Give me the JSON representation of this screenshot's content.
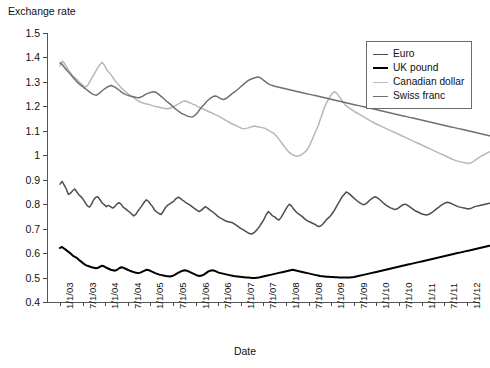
{
  "chart_data": {
    "type": "line",
    "title": "",
    "xlabel": "Date",
    "ylabel": "Exchange rate",
    "ylim": [
      0.4,
      1.5
    ],
    "ytick_labels": [
      "1.5",
      "1.4",
      "1.3",
      "1.2",
      "1.1",
      "1",
      "0.9",
      "0.8",
      "0.7",
      "0.6",
      "0.5",
      "0.4"
    ],
    "ytick_values": [
      1.5,
      1.4,
      1.3,
      1.2,
      1.1,
      1.0,
      0.9,
      0.8,
      0.7,
      0.6,
      0.5,
      0.4
    ],
    "grid": false,
    "legend_position": "top-right",
    "x_start": "1/1/03",
    "x_end": "7/1/12",
    "xtick_labels": [
      "1/1/03",
      "7/1/03",
      "1/1/04",
      "7/1/04",
      "1/1/05",
      "7/1/05",
      "1/1/06",
      "7/1/06",
      "1/1/07",
      "7/1/07",
      "1/1/08",
      "7/1/08",
      "1/1/09",
      "7/1/09",
      "1/1/10",
      "7/1/10",
      "1/1/11",
      "7/1/11",
      "1/1/12"
    ],
    "series": [
      {
        "name": "Euro",
        "color": "#4d4d4d",
        "width": 1.5,
        "values": [
          0.882,
          0.893,
          0.878,
          0.862,
          0.84,
          0.845,
          0.855,
          0.862,
          0.85,
          0.838,
          0.83,
          0.82,
          0.806,
          0.793,
          0.788,
          0.8,
          0.818,
          0.828,
          0.83,
          0.818,
          0.805,
          0.798,
          0.79,
          0.795,
          0.79,
          0.784,
          0.79,
          0.8,
          0.806,
          0.8,
          0.788,
          0.782,
          0.775,
          0.768,
          0.76,
          0.752,
          0.758,
          0.772,
          0.783,
          0.795,
          0.808,
          0.818,
          0.812,
          0.8,
          0.79,
          0.775,
          0.768,
          0.762,
          0.758,
          0.77,
          0.785,
          0.795,
          0.8,
          0.806,
          0.812,
          0.822,
          0.828,
          0.825,
          0.818,
          0.812,
          0.805,
          0.8,
          0.795,
          0.788,
          0.782,
          0.776,
          0.77,
          0.774,
          0.782,
          0.79,
          0.785,
          0.778,
          0.772,
          0.765,
          0.758,
          0.75,
          0.744,
          0.74,
          0.735,
          0.73,
          0.728,
          0.726,
          0.724,
          0.718,
          0.712,
          0.706,
          0.7,
          0.696,
          0.69,
          0.685,
          0.68,
          0.678,
          0.682,
          0.69,
          0.7,
          0.712,
          0.725,
          0.74,
          0.758,
          0.77,
          0.762,
          0.752,
          0.748,
          0.74,
          0.735,
          0.745,
          0.76,
          0.775,
          0.79,
          0.8,
          0.792,
          0.78,
          0.77,
          0.762,
          0.756,
          0.75,
          0.742,
          0.735,
          0.73,
          0.726,
          0.722,
          0.718,
          0.712,
          0.708,
          0.712,
          0.72,
          0.73,
          0.74,
          0.748,
          0.758,
          0.77,
          0.785,
          0.8,
          0.815,
          0.83,
          0.84,
          0.85,
          0.845,
          0.838,
          0.83,
          0.822,
          0.815,
          0.808,
          0.802,
          0.798,
          0.8,
          0.806,
          0.815,
          0.822,
          0.828,
          0.83,
          0.825,
          0.818,
          0.81,
          0.802,
          0.795,
          0.79,
          0.785,
          0.782,
          0.778,
          0.78,
          0.786,
          0.792,
          0.798,
          0.8,
          0.796,
          0.79,
          0.784,
          0.778,
          0.772,
          0.768,
          0.764,
          0.76,
          0.758,
          0.756,
          0.758,
          0.762,
          0.768,
          0.775,
          0.782,
          0.788,
          0.795,
          0.8,
          0.805,
          0.808,
          0.806,
          0.802,
          0.798,
          0.794,
          0.79,
          0.788,
          0.786,
          0.784,
          0.782,
          0.78,
          0.782,
          0.786,
          0.79,
          0.792,
          0.794,
          0.796,
          0.798,
          0.8,
          0.802,
          0.804
        ]
      },
      {
        "name": "UK pound",
        "color": "#000000",
        "width": 2.0,
        "values": [
          0.621,
          0.625,
          0.618,
          0.612,
          0.605,
          0.598,
          0.59,
          0.585,
          0.58,
          0.572,
          0.565,
          0.558,
          0.552,
          0.548,
          0.545,
          0.542,
          0.54,
          0.538,
          0.54,
          0.545,
          0.548,
          0.545,
          0.54,
          0.536,
          0.532,
          0.53,
          0.528,
          0.532,
          0.538,
          0.542,
          0.54,
          0.536,
          0.532,
          0.528,
          0.525,
          0.522,
          0.52,
          0.518,
          0.52,
          0.524,
          0.528,
          0.532,
          0.53,
          0.526,
          0.522,
          0.518,
          0.515,
          0.512,
          0.51,
          0.508,
          0.506,
          0.505,
          0.504,
          0.506,
          0.51,
          0.515,
          0.52,
          0.524,
          0.528,
          0.53,
          0.528,
          0.524,
          0.52,
          0.516,
          0.512,
          0.508,
          0.506,
          0.508,
          0.512,
          0.518,
          0.524,
          0.528,
          0.53,
          0.528,
          0.524,
          0.52,
          0.518,
          0.516,
          0.514,
          0.512,
          0.51,
          0.508,
          0.506,
          0.505,
          0.504,
          0.503,
          0.502,
          0.501,
          0.5,
          0.5,
          0.499,
          0.498,
          0.498,
          0.499,
          0.5,
          0.502,
          0.504,
          0.506,
          0.508,
          0.51,
          0.512,
          0.514,
          0.516,
          0.518,
          0.52,
          0.522,
          0.524,
          0.526,
          0.528,
          0.53,
          0.532,
          0.53,
          0.528,
          0.526,
          0.524,
          0.522,
          0.52,
          0.518,
          0.516,
          0.514,
          0.512,
          0.51,
          0.508,
          0.506,
          0.505,
          0.504,
          0.503,
          0.503,
          0.502,
          0.502,
          0.501,
          0.501,
          0.5,
          0.5,
          0.5,
          0.5,
          0.5,
          0.5,
          0.501,
          0.502,
          0.504,
          0.506,
          0.508,
          0.51,
          0.512,
          0.514,
          0.516,
          0.518,
          0.52,
          0.522,
          0.524,
          0.526,
          0.528,
          0.53,
          0.532,
          0.534,
          0.536,
          0.538,
          0.54,
          0.542,
          0.544,
          0.546,
          0.548,
          0.55,
          0.552,
          0.554,
          0.556,
          0.558,
          0.56,
          0.562,
          0.564,
          0.566,
          0.568,
          0.57,
          0.572,
          0.574,
          0.576,
          0.578,
          0.58,
          0.582,
          0.584,
          0.586,
          0.588,
          0.59,
          0.592,
          0.594,
          0.596,
          0.598,
          0.6,
          0.602,
          0.604,
          0.606,
          0.608,
          0.61,
          0.612,
          0.614,
          0.616,
          0.618,
          0.62,
          0.622,
          0.624,
          0.626,
          0.628,
          0.63
        ]
      },
      {
        "name": "Canadian dollar",
        "color": "#b7b7b7",
        "width": 1.5,
        "values": [
          1.365,
          1.385,
          1.378,
          1.362,
          1.348,
          1.338,
          1.325,
          1.318,
          1.31,
          1.3,
          1.292,
          1.285,
          1.278,
          1.285,
          1.3,
          1.315,
          1.33,
          1.345,
          1.36,
          1.372,
          1.38,
          1.368,
          1.352,
          1.34,
          1.33,
          1.318,
          1.305,
          1.295,
          1.285,
          1.275,
          1.268,
          1.26,
          1.252,
          1.245,
          1.24,
          1.235,
          1.228,
          1.222,
          1.218,
          1.215,
          1.212,
          1.21,
          1.208,
          1.205,
          1.202,
          1.2,
          1.198,
          1.196,
          1.194,
          1.192,
          1.19,
          1.19,
          1.192,
          1.196,
          1.2,
          1.205,
          1.21,
          1.215,
          1.22,
          1.222,
          1.22,
          1.216,
          1.212,
          1.208,
          1.205,
          1.2,
          1.196,
          1.192,
          1.188,
          1.184,
          1.18,
          1.176,
          1.172,
          1.168,
          1.164,
          1.16,
          1.155,
          1.15,
          1.145,
          1.14,
          1.135,
          1.13,
          1.126,
          1.122,
          1.118,
          1.114,
          1.11,
          1.108,
          1.11,
          1.112,
          1.115,
          1.118,
          1.12,
          1.118,
          1.116,
          1.114,
          1.112,
          1.11,
          1.105,
          1.1,
          1.095,
          1.09,
          1.082,
          1.072,
          1.06,
          1.048,
          1.036,
          1.025,
          1.015,
          1.008,
          1.002,
          0.998,
          0.996,
          0.998,
          1.002,
          1.008,
          1.015,
          1.025,
          1.04,
          1.06,
          1.08,
          1.1,
          1.12,
          1.145,
          1.17,
          1.195,
          1.215,
          1.23,
          1.245,
          1.255,
          1.26,
          1.252,
          1.24,
          1.228,
          1.215,
          1.205,
          1.198,
          1.192,
          1.186,
          1.18,
          1.175,
          1.17,
          1.165,
          1.16,
          1.155,
          1.15,
          1.145,
          1.14,
          1.135,
          1.13,
          1.126,
          1.122,
          1.118,
          1.114,
          1.11,
          1.106,
          1.102,
          1.098,
          1.094,
          1.09,
          1.086,
          1.082,
          1.078,
          1.074,
          1.07,
          1.066,
          1.062,
          1.058,
          1.054,
          1.05,
          1.046,
          1.042,
          1.038,
          1.034,
          1.03,
          1.026,
          1.022,
          1.018,
          1.014,
          1.01,
          1.006,
          1.002,
          0.998,
          0.994,
          0.99,
          0.986,
          0.982,
          0.978,
          0.976,
          0.974,
          0.972,
          0.97,
          0.968,
          0.966,
          0.968,
          0.972,
          0.978,
          0.984,
          0.99,
          0.996,
          1.0,
          1.006,
          1.01,
          1.014
        ]
      },
      {
        "name": "Swiss franc",
        "color": "#707070",
        "width": 1.5,
        "values": [
          1.378,
          1.372,
          1.36,
          1.35,
          1.34,
          1.33,
          1.32,
          1.31,
          1.3,
          1.292,
          1.285,
          1.278,
          1.272,
          1.265,
          1.258,
          1.252,
          1.248,
          1.245,
          1.25,
          1.258,
          1.265,
          1.272,
          1.278,
          1.282,
          1.285,
          1.282,
          1.278,
          1.272,
          1.265,
          1.258,
          1.252,
          1.248,
          1.245,
          1.242,
          1.24,
          1.238,
          1.236,
          1.235,
          1.238,
          1.242,
          1.248,
          1.252,
          1.255,
          1.258,
          1.26,
          1.258,
          1.252,
          1.245,
          1.238,
          1.23,
          1.222,
          1.215,
          1.208,
          1.2,
          1.192,
          1.185,
          1.178,
          1.172,
          1.168,
          1.164,
          1.16,
          1.158,
          1.156,
          1.16,
          1.168,
          1.178,
          1.19,
          1.2,
          1.21,
          1.22,
          1.228,
          1.235,
          1.24,
          1.242,
          1.24,
          1.235,
          1.23,
          1.228,
          1.232,
          1.238,
          1.245,
          1.252,
          1.258,
          1.265,
          1.272,
          1.28,
          1.288,
          1.295,
          1.302,
          1.308,
          1.312,
          1.315,
          1.318,
          1.32,
          1.318,
          1.312,
          1.305,
          1.298,
          1.292,
          1.288,
          1.285,
          1.282,
          1.28,
          1.278,
          1.276,
          1.274,
          1.272,
          1.27,
          1.268,
          1.266,
          1.264,
          1.262,
          1.26,
          1.258,
          1.256,
          1.254,
          1.252,
          1.25,
          1.248,
          1.246,
          1.244,
          1.242,
          1.24,
          1.238,
          1.236,
          1.234,
          1.232,
          1.23,
          1.228,
          1.226,
          1.224,
          1.222,
          1.22,
          1.218,
          1.216,
          1.214,
          1.212,
          1.21,
          1.208,
          1.206,
          1.204,
          1.202,
          1.2,
          1.198,
          1.196,
          1.194,
          1.192,
          1.19,
          1.188,
          1.186,
          1.184,
          1.182,
          1.18,
          1.178,
          1.176,
          1.174,
          1.172,
          1.17,
          1.168,
          1.166,
          1.164,
          1.162,
          1.16,
          1.158,
          1.156,
          1.154,
          1.152,
          1.15,
          1.148,
          1.146,
          1.144,
          1.142,
          1.14,
          1.138,
          1.136,
          1.134,
          1.132,
          1.13,
          1.128,
          1.126,
          1.124,
          1.122,
          1.12,
          1.118,
          1.116,
          1.114,
          1.112,
          1.11,
          1.108,
          1.106,
          1.104,
          1.102,
          1.1,
          1.098,
          1.096,
          1.094,
          1.092,
          1.09,
          1.088,
          1.086,
          1.084,
          1.082,
          1.08
        ]
      }
    ],
    "legend": [
      {
        "label": "Euro",
        "color": "#4d4d4d",
        "width": 1.8
      },
      {
        "label": "UK pound",
        "color": "#000000",
        "width": 2.6
      },
      {
        "label": "Canadian dollar",
        "color": "#bdbdbd",
        "width": 1.8
      },
      {
        "label": "Swiss franc",
        "color": "#707070",
        "width": 1.8
      }
    ]
  }
}
